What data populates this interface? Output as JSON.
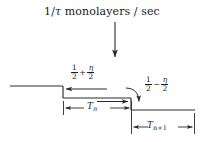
{
  "figure": {
    "background_color": "#ffffff",
    "line_color": "#1a1a1a",
    "flux_label": {
      "text": "1/τ monolayers / sec",
      "prefix": "1/",
      "symbol": "τ",
      "suffix": " monolayers / sec"
    },
    "labels": {
      "up_step": {
        "name": "one-half-plus-eta-over-two",
        "first_numerator": "1",
        "first_denominator": "2",
        "operator": "+",
        "second_numerator": "η",
        "second_denominator": "2",
        "plain": "1/2 + η/2"
      },
      "down_step": {
        "name": "one-half-minus-eta-over-two",
        "first_numerator": "1",
        "first_denominator": "2",
        "operator": "−",
        "second_numerator": "η",
        "second_denominator": "2",
        "plain": "1/2 − η/2"
      },
      "terrace_n": {
        "base": "T",
        "subscript": "n",
        "plain": "T_n"
      },
      "terrace_n_plus_1": {
        "base": "T",
        "subscript": "n+1",
        "plain": "T_{n+1}"
      }
    },
    "icons": {
      "flux_arrow": "down-arrow-icon",
      "left_flow_arrow": "left-arrow-icon",
      "right_flow_arrow": "right-arrow-icon",
      "curved_arrow": "curved-down-arrow-icon",
      "tn_dimension": "double-headed-arrow-icon",
      "tn1_dimension": "double-headed-arrow-icon"
    },
    "geometry": {
      "upper_terrace_y": 86,
      "middle_terrace_y": 98,
      "lower_terrace_y": 110,
      "step1_x": 63,
      "step2_x": 131,
      "left_edge_x": 10,
      "right_edge_x": 195,
      "flux_arrow_x": 115,
      "flux_arrow_y_start": 22,
      "flux_arrow_y_end": 58
    }
  }
}
